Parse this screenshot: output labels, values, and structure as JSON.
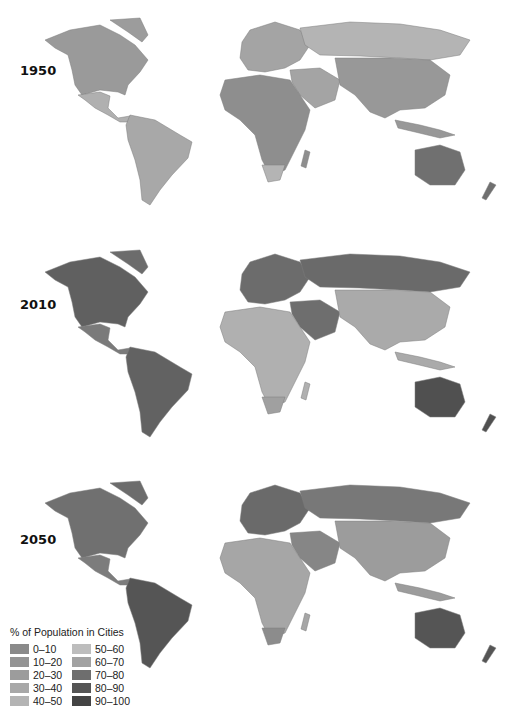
{
  "legend": {
    "title": "% of Population in Cities",
    "items": [
      {
        "label": "0–10",
        "color": "#8a8a8a"
      },
      {
        "label": "10–20",
        "color": "#949494"
      },
      {
        "label": "20–30",
        "color": "#9c9c9c"
      },
      {
        "label": "30–40",
        "color": "#a8a8a8"
      },
      {
        "label": "40–50",
        "color": "#b4b4b4"
      },
      {
        "label": "50–60",
        "color": "#bdbdbd"
      },
      {
        "label": "60–70",
        "color": "#a2a2a2"
      },
      {
        "label": "70–80",
        "color": "#6e6e6e"
      },
      {
        "label": "80–90",
        "color": "#555555"
      },
      {
        "label": "90–100",
        "color": "#444444"
      }
    ]
  },
  "panels": [
    {
      "year": "1950",
      "colors": {
        "north_america": "#9a9a9a",
        "central_america": "#b0b0b0",
        "south_america": "#a8a8a8",
        "europe": "#a4a4a4",
        "russia": "#b4b4b4",
        "asia": "#989898",
        "middle_east": "#a4a4a4",
        "africa": "#8e8e8e",
        "south_africa": "#b4b4b4",
        "australia": "#707070",
        "greenland": "#9c9c9c"
      }
    },
    {
      "year": "2010",
      "colors": {
        "north_america": "#606060",
        "central_america": "#7a7a7a",
        "south_america": "#626262",
        "europe": "#6c6c6c",
        "russia": "#6a6a6a",
        "asia": "#aaaaaa",
        "middle_east": "#6e6e6e",
        "africa": "#b0b0b0",
        "south_africa": "#a0a0a0",
        "australia": "#505050",
        "greenland": "#6c6c6c"
      }
    },
    {
      "year": "2050",
      "colors": {
        "north_america": "#707070",
        "central_america": "#7c7c7c",
        "south_america": "#555555",
        "europe": "#6a6a6a",
        "russia": "#787878",
        "asia": "#9c9c9c",
        "middle_east": "#868686",
        "africa": "#a6a6a6",
        "south_africa": "#8c8c8c",
        "australia": "#555555",
        "greenland": "#6c6c6c"
      }
    }
  ],
  "chart_data": {
    "type": "choropleth",
    "title": "% of Population in Cities",
    "years": [
      "1950",
      "2010",
      "2050"
    ],
    "legend_bins": [
      "0–10",
      "10–20",
      "20–30",
      "30–40",
      "40–50",
      "50–60",
      "60–70",
      "70–80",
      "80–90",
      "90–100"
    ]
  }
}
